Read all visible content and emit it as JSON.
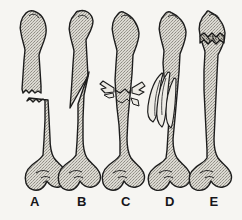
{
  "figure": {
    "caption": "",
    "background_color": "#f6f5f2",
    "ink_color": "#1a1a1a",
    "bone_fill_color": "#d8d6cf",
    "style": "stippled line drawing"
  },
  "bones": [
    {
      "id": "bone-a",
      "label": "A",
      "label_x": 35,
      "fracture_type": "transverse",
      "description": "Jagged horizontal break across the shaft; the two fragments are separated and slightly offset."
    },
    {
      "id": "bone-b",
      "label": "B",
      "label_x": 82,
      "fracture_type": "oblique",
      "description": "Long diagonal break across the shaft producing a sharp pointed spike on the upper fragment."
    },
    {
      "id": "bone-c",
      "label": "C",
      "label_x": 126,
      "fracture_type": "greenstick-splintered",
      "description": "Shaft cracked with thin sliver fragments splintering outward to both sides."
    },
    {
      "id": "bone-d",
      "label": "D",
      "label_x": 170,
      "fracture_type": "comminuted",
      "description": "Shaft shattered into several long spindle-shaped fragments displaced to one side."
    },
    {
      "id": "bone-e",
      "label": "E",
      "label_x": 214,
      "fracture_type": "impacted",
      "description": "Dark compressed zigzag band just below the proximal head where one fragment is driven into the other."
    }
  ]
}
